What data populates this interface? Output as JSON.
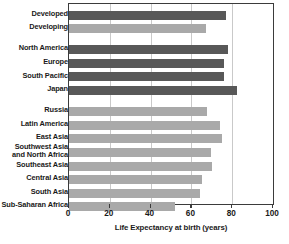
{
  "chart_data": {
    "type": "bar",
    "orientation": "horizontal",
    "title": "",
    "xlabel": "Life Expectancy at birth (years)",
    "ylabel": "",
    "xlim": [
      0,
      100
    ],
    "xticks": [
      0,
      20,
      40,
      60,
      80,
      100
    ],
    "xtick_labels": [
      "0",
      "20",
      "40",
      "60",
      "80",
      "100"
    ],
    "grid": "vertical",
    "legend": "none",
    "colors": {
      "developed": "#585858",
      "developing": "#a9a9a9",
      "axis": "#3b3b3b",
      "gridline": "#c9c9c9",
      "background": "#ffffff",
      "text": "#1a1a1a"
    },
    "categories": [
      "Developed",
      "Developing",
      "North America",
      "Europe",
      "South Pacific",
      "Japan",
      "Russia",
      "Latin America",
      "East Asia",
      "Southwest Asia\nand North Africa",
      "Southeast Asia",
      "Central Asia",
      "South Asia",
      "Sub-Saharan Africa"
    ],
    "values": [
      77,
      67,
      78,
      76,
      76,
      82.5,
      67.5,
      74,
      75,
      69.5,
      70,
      65,
      64,
      52
    ],
    "bars": [
      {
        "label": "Developed",
        "value": 77,
        "shade": "dark",
        "group": 0
      },
      {
        "label": "Developing",
        "value": 67,
        "shade": "light",
        "group": 0
      },
      {
        "label": "North America",
        "value": 78,
        "shade": "dark",
        "group": 1
      },
      {
        "label": "Europe",
        "value": 76,
        "shade": "dark",
        "group": 1
      },
      {
        "label": "South Pacific",
        "value": 76,
        "shade": "dark",
        "group": 1
      },
      {
        "label": "Japan",
        "value": 82.5,
        "shade": "dark",
        "group": 1
      },
      {
        "label": "Russia",
        "value": 67.5,
        "shade": "light",
        "group": 2
      },
      {
        "label": "Latin America",
        "value": 74,
        "shade": "light",
        "group": 2
      },
      {
        "label": "East Asia",
        "value": 75,
        "shade": "light",
        "group": 2
      },
      {
        "label": "Southwest Asia\nand North Africa",
        "value": 69.5,
        "shade": "light",
        "group": 2
      },
      {
        "label": "Southeast Asia",
        "value": 70,
        "shade": "light",
        "group": 2
      },
      {
        "label": "Central Asia",
        "value": 65,
        "shade": "light",
        "group": 2
      },
      {
        "label": "South Asia",
        "value": 64,
        "shade": "light",
        "group": 2
      },
      {
        "label": "Sub-Saharan Africa",
        "value": 52,
        "shade": "light",
        "group": 2
      }
    ]
  }
}
